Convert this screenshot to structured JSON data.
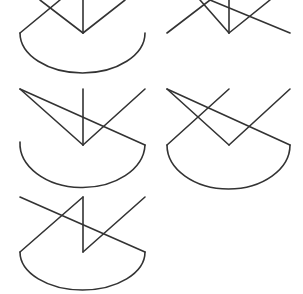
{
  "canvas": {
    "width": 303,
    "height": 294,
    "background": "#ffffff"
  },
  "style": {
    "stroke_color": "#333333",
    "stroke_width": 1.6
  },
  "figures": [
    {
      "id": "figure-1",
      "lines": [
        [
          83,
          0,
          83,
          33
        ],
        [
          83,
          33,
          125,
          0
        ],
        [
          20,
          33,
          60,
          0
        ],
        [
          40,
          0,
          83,
          33
        ]
      ],
      "arc": {
        "x1": 20,
        "y1": 33,
        "x2": 145,
        "y2": 33,
        "rx": 62.5,
        "ry": 40,
        "path": "M20 33 A62.5 40 0 0 0 145 33"
      }
    },
    {
      "id": "figure-2",
      "lines": [
        [
          229,
          0,
          229,
          33
        ],
        [
          229,
          33,
          270,
          0
        ],
        [
          167,
          33,
          210,
          0
        ],
        [
          200,
          0,
          229,
          33
        ],
        [
          210,
          0,
          290,
          33
        ]
      ],
      "arc": null
    },
    {
      "id": "figure-3",
      "lines": [
        [
          83,
          89,
          83,
          145
        ],
        [
          83,
          145,
          145,
          89
        ],
        [
          20,
          89,
          83,
          145
        ],
        [
          20,
          89,
          145,
          145
        ]
      ],
      "arc": {
        "x1": 20,
        "y1": 142,
        "x2": 145,
        "y2": 145,
        "rx": 62.5,
        "ry": 44,
        "path": "M20 142 A62.5 44 0 0 0 145 145"
      }
    },
    {
      "id": "figure-4",
      "lines": [
        [
          229,
          145,
          290,
          89
        ],
        [
          167,
          89,
          229,
          145
        ],
        [
          167,
          89,
          290,
          145
        ],
        [
          167,
          145,
          229,
          89
        ]
      ],
      "arc": {
        "x1": 167,
        "y1": 145,
        "x2": 290,
        "y2": 145,
        "rx": 61.5,
        "ry": 44,
        "path": "M167 145 A61.5 44 0 0 0 290 145"
      }
    },
    {
      "id": "figure-5",
      "lines": [
        [
          83,
          252,
          83,
          197
        ],
        [
          83,
          197,
          20,
          252
        ],
        [
          83,
          252,
          145,
          197
        ],
        [
          20,
          197,
          145,
          252
        ]
      ],
      "arc": {
        "x1": 20,
        "y1": 252,
        "x2": 145,
        "y2": 252,
        "rx": 62.5,
        "ry": 38,
        "path": "M20 252 A62.5 38 0 0 0 145 252"
      }
    }
  ]
}
